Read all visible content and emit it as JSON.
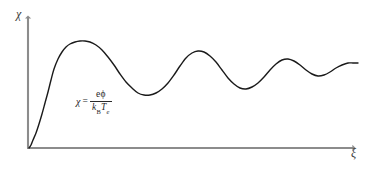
{
  "figure": {
    "background_color": "#ffffff",
    "axis_color": "#8c8c8c",
    "curve_color": "#1a1a1a"
  },
  "axes": {
    "y_label": "χ",
    "x_label": "ξ",
    "y_label_name": "chi",
    "x_label_name": "xi",
    "origin_px": [
      28,
      148
    ],
    "x_axis_end_px": [
      358,
      148
    ],
    "y_axis_top_px": [
      28,
      14
    ],
    "arrowheads": true,
    "ticks": false,
    "gridlines": false
  },
  "annotation": {
    "lhs": "χ",
    "equals": "=",
    "numerator_charge": "e",
    "numerator_potential": "ϕ",
    "denominator_k": "k",
    "denominator_k_sub": "B",
    "denominator_T": "T",
    "denominator_T_sub": "e",
    "full_text": "χ = eϕ / (k_B T_e)"
  },
  "caption": {
    "sliver_text": " "
  },
  "chart_data": {
    "type": "line",
    "title": "",
    "xlabel": "ξ",
    "ylabel": "χ",
    "xlim": [
      0,
      1
    ],
    "ylim": [
      0,
      1
    ],
    "grid": false,
    "legend": null,
    "series": [
      {
        "name": "chi(xi)",
        "color": "#1a1a1a",
        "linewidth": 1.4,
        "points_px": [
          [
            29,
            148
          ],
          [
            31,
            145
          ],
          [
            33,
            140
          ],
          [
            36,
            133
          ],
          [
            39,
            124
          ],
          [
            42,
            114
          ],
          [
            45,
            103
          ],
          [
            48,
            92
          ],
          [
            51,
            80
          ],
          [
            54,
            69
          ],
          [
            58,
            59
          ],
          [
            62,
            52
          ],
          [
            66,
            47
          ],
          [
            70,
            44
          ],
          [
            75,
            42
          ],
          [
            80,
            41
          ],
          [
            85,
            41
          ],
          [
            90,
            42
          ],
          [
            96,
            45
          ],
          [
            102,
            50
          ],
          [
            108,
            57
          ],
          [
            114,
            65
          ],
          [
            120,
            74
          ],
          [
            126,
            82
          ],
          [
            132,
            88
          ],
          [
            138,
            93
          ],
          [
            144,
            95
          ],
          [
            150,
            95
          ],
          [
            156,
            93
          ],
          [
            162,
            89
          ],
          [
            168,
            83
          ],
          [
            174,
            75
          ],
          [
            180,
            66
          ],
          [
            186,
            58
          ],
          [
            192,
            53
          ],
          [
            198,
            51
          ],
          [
            204,
            52
          ],
          [
            210,
            56
          ],
          [
            216,
            62
          ],
          [
            222,
            70
          ],
          [
            228,
            78
          ],
          [
            234,
            84
          ],
          [
            240,
            88
          ],
          [
            246,
            89
          ],
          [
            252,
            87
          ],
          [
            258,
            83
          ],
          [
            264,
            77
          ],
          [
            270,
            70
          ],
          [
            276,
            64
          ],
          [
            282,
            60
          ],
          [
            288,
            59
          ],
          [
            294,
            61
          ],
          [
            300,
            65
          ],
          [
            306,
            70
          ],
          [
            312,
            74
          ],
          [
            318,
            76
          ],
          [
            324,
            75
          ],
          [
            330,
            72
          ],
          [
            336,
            68
          ],
          [
            342,
            65
          ],
          [
            348,
            63
          ],
          [
            353,
            63
          ],
          [
            358,
            63
          ]
        ],
        "features": {
          "first_peak": {
            "x_px": 84,
            "y_px": 41,
            "label": "first overshoot"
          },
          "first_trough": {
            "x_px": 148,
            "y_px": 95
          },
          "second_peak": {
            "x_px": 199,
            "y_px": 51
          },
          "second_trough": {
            "x_px": 245,
            "y_px": 89
          },
          "third_peak": {
            "x_px": 288,
            "y_px": 59
          },
          "third_trough": {
            "x_px": 318,
            "y_px": 76
          },
          "asymptote_y_px": 63
        }
      }
    ]
  }
}
